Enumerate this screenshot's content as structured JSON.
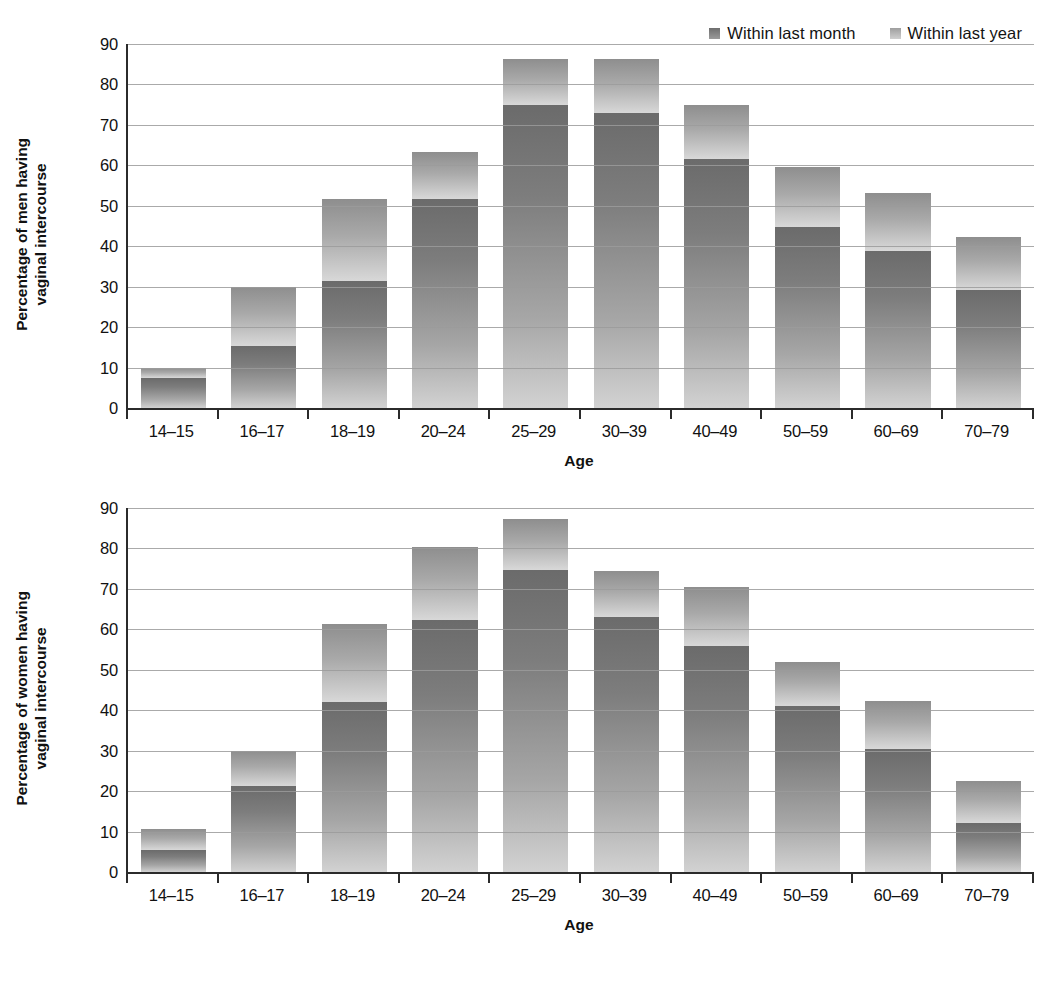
{
  "legend": {
    "items": [
      {
        "label": "Within last month",
        "key": "month",
        "swatch_color": "#7a7a7a"
      },
      {
        "label": "Within last year",
        "key": "year",
        "swatch_color": "#b4b4b4"
      }
    ]
  },
  "charts": [
    {
      "id": "chart-men",
      "ylabel_line1": "Percentage of men having",
      "ylabel_line2": "vaginal intercourse",
      "xlabel": "Age"
    },
    {
      "id": "chart-women",
      "ylabel_line1": "Percentage of women having",
      "ylabel_line2": "vaginal intercourse",
      "xlabel": "Age"
    }
  ],
  "chart_data": [
    {
      "type": "bar",
      "stacked": true,
      "title": "Percentage of men having vaginal intercourse",
      "xlabel": "Age",
      "ylabel": "Percentage of men having vaginal intercourse",
      "categories": [
        "14–15",
        "16–17",
        "18–19",
        "20–24",
        "25–29",
        "30–39",
        "40–49",
        "50–59",
        "60–69",
        "70–79"
      ],
      "series": [
        {
          "name": "Within last month",
          "values": [
            7.5,
            15.4,
            31.5,
            51.8,
            74.8,
            73.0,
            61.5,
            44.8,
            38.8,
            29.2
          ]
        },
        {
          "name": "Within last year",
          "values": [
            9.8,
            30.0,
            51.7,
            63.2,
            86.3,
            86.2,
            75.0,
            59.5,
            53.2,
            42.2
          ]
        }
      ],
      "ylim": [
        0,
        90
      ],
      "yticks": [
        0,
        10,
        20,
        30,
        40,
        50,
        60,
        70,
        80,
        90
      ],
      "grid": true,
      "legend_position": "top-right"
    },
    {
      "type": "bar",
      "stacked": true,
      "title": "Percentage of women having vaginal intercourse",
      "xlabel": "Age",
      "ylabel": "Percentage of women having vaginal intercourse",
      "categories": [
        "14–15",
        "16–17",
        "18–19",
        "20–24",
        "25–29",
        "30–39",
        "40–49",
        "50–59",
        "60–69",
        "70–79"
      ],
      "series": [
        {
          "name": "Within last month",
          "values": [
            5.4,
            21.2,
            42.0,
            62.2,
            74.6,
            63.0,
            55.8,
            41.0,
            30.4,
            12.2
          ]
        },
        {
          "name": "Within last year",
          "values": [
            10.7,
            29.9,
            61.3,
            80.4,
            87.4,
            74.5,
            70.5,
            52.0,
            42.4,
            22.6
          ]
        }
      ],
      "ylim": [
        0,
        90
      ],
      "yticks": [
        0,
        10,
        20,
        30,
        40,
        50,
        60,
        70,
        80,
        90
      ],
      "grid": true,
      "legend_position": "top-right"
    }
  ]
}
